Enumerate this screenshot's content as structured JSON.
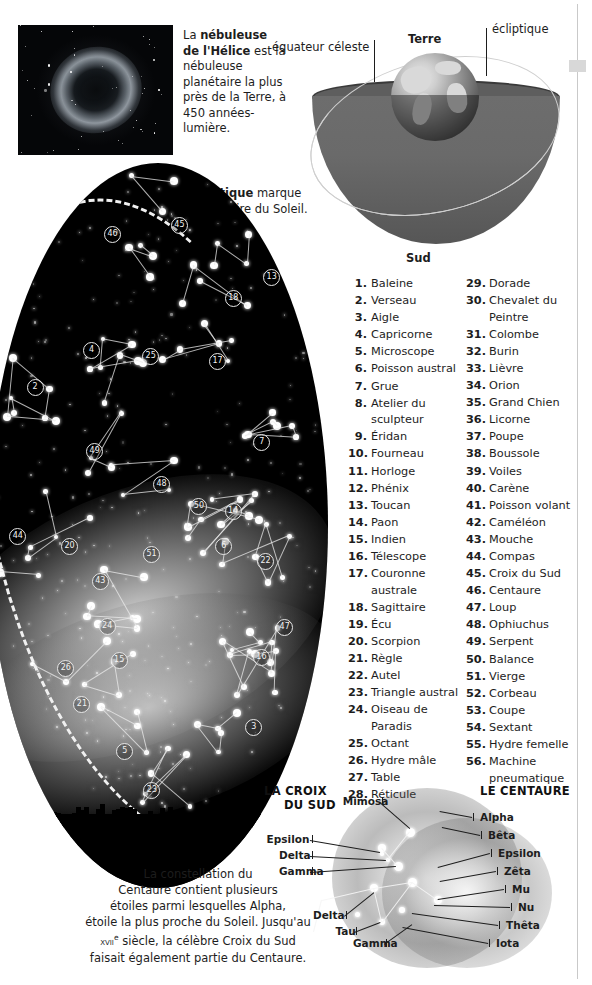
{
  "nebula": {
    "caption_lead": "La ",
    "caption_bold": "nébuleuse de l'Hélice",
    "caption_rest": " est la nébuleuse planétaire la plus près de la Terre, à 450 années-lumière."
  },
  "ecliptic_caption": {
    "bold": "L'écliptique",
    "rest": " marque la trajectoire du Soleil."
  },
  "sphere": {
    "label_equator": "équateur céleste",
    "label_earth": "Terre",
    "label_ecliptic": "écliptique",
    "label_south": "Sud"
  },
  "constellations": {
    "left": [
      {
        "num": "1.",
        "name": "Baleine"
      },
      {
        "num": "2.",
        "name": "Verseau"
      },
      {
        "num": "3.",
        "name": "Aigle"
      },
      {
        "num": "4.",
        "name": "Capricorne"
      },
      {
        "num": "5.",
        "name": "Microscope"
      },
      {
        "num": "6.",
        "name": "Poisson austral"
      },
      {
        "num": "7.",
        "name": "Grue"
      },
      {
        "num": "8.",
        "name": "Atelier du sculpteur"
      },
      {
        "num": "9.",
        "name": "Éridan"
      },
      {
        "num": "10.",
        "name": "Fourneau"
      },
      {
        "num": "11.",
        "name": "Horloge"
      },
      {
        "num": "12.",
        "name": "Phénix"
      },
      {
        "num": "13.",
        "name": "Toucan"
      },
      {
        "num": "14.",
        "name": "Paon"
      },
      {
        "num": "15.",
        "name": "Indien"
      },
      {
        "num": "16.",
        "name": "Télescope"
      },
      {
        "num": "17.",
        "name": "Couronne australe"
      },
      {
        "num": "18.",
        "name": "Sagittaire"
      },
      {
        "num": "19.",
        "name": "Écu"
      },
      {
        "num": "20.",
        "name": "Scorpion"
      },
      {
        "num": "21.",
        "name": "Règle"
      },
      {
        "num": "22.",
        "name": "Autel"
      },
      {
        "num": "23.",
        "name": "Triangle austral"
      },
      {
        "num": "24.",
        "name": "Oiseau de Paradis"
      },
      {
        "num": "25.",
        "name": "Octant"
      },
      {
        "num": "26.",
        "name": "Hydre mâle"
      },
      {
        "num": "27.",
        "name": "Table"
      },
      {
        "num": "28.",
        "name": "Réticule"
      }
    ],
    "right": [
      {
        "num": "29.",
        "name": "Dorade"
      },
      {
        "num": "30.",
        "name": "Chevalet du Peintre"
      },
      {
        "num": "31.",
        "name": "Colombe"
      },
      {
        "num": "32.",
        "name": "Burin"
      },
      {
        "num": "33.",
        "name": "Lièvre"
      },
      {
        "num": "34.",
        "name": "Orion"
      },
      {
        "num": "35.",
        "name": "Grand Chien"
      },
      {
        "num": "36.",
        "name": "Licorne"
      },
      {
        "num": "37.",
        "name": "Poupe"
      },
      {
        "num": "38.",
        "name": "Boussole"
      },
      {
        "num": "39.",
        "name": "Voiles"
      },
      {
        "num": "40.",
        "name": "Carène"
      },
      {
        "num": "41.",
        "name": "Poisson volant"
      },
      {
        "num": "42.",
        "name": "Caméléon"
      },
      {
        "num": "43.",
        "name": "Mouche"
      },
      {
        "num": "44.",
        "name": "Compas"
      },
      {
        "num": "45.",
        "name": "Croix du Sud"
      },
      {
        "num": "46.",
        "name": "Centaure"
      },
      {
        "num": "47.",
        "name": "Loup"
      },
      {
        "num": "48.",
        "name": "Ophiuchus"
      },
      {
        "num": "49.",
        "name": "Serpent"
      },
      {
        "num": "50.",
        "name": "Balance"
      },
      {
        "num": "51.",
        "name": "Vierge"
      },
      {
        "num": "52.",
        "name": "Corbeau"
      },
      {
        "num": "53.",
        "name": "Coupe"
      },
      {
        "num": "54.",
        "name": "Sextant"
      },
      {
        "num": "55.",
        "name": "Hydre femelle"
      },
      {
        "num": "56.",
        "name": "Machine pneumatique"
      }
    ]
  },
  "chart_markers": [
    "2",
    "3",
    "4",
    "5",
    "6",
    "7",
    "13",
    "14",
    "15",
    "16",
    "17",
    "18",
    "20",
    "21",
    "22",
    "23",
    "24",
    "25",
    "26",
    "43",
    "44",
    "45",
    "46",
    "47",
    "48",
    "49",
    "50",
    "51"
  ],
  "bottom_caption": {
    "line1": "La constellation du",
    "line2": "Centaure contient plusieurs",
    "line3": "étoiles parmi lesquelles Alpha,",
    "line4": "étoile la plus proche du Soleil. Jusqu'au",
    "century": "xvii",
    "century_sup": "e",
    "line5_rest": " siècle, la célèbre Croix du Sud",
    "line6": "faisait également partie du Centaure."
  },
  "croix_map": {
    "title_line1": "LA CROIX",
    "title_line2": "DU SUD",
    "labels": [
      {
        "text": "Mimosa"
      },
      {
        "text": "Epsilon"
      },
      {
        "text": "Delta"
      },
      {
        "text": "Gamma"
      },
      {
        "text": "Delta"
      },
      {
        "text": "Tau"
      },
      {
        "text": "Gamma"
      }
    ]
  },
  "centaure_map": {
    "title": "LE CENTAURE",
    "labels": [
      {
        "text": "Alpha"
      },
      {
        "text": "Bêta"
      },
      {
        "text": "Epsilon"
      },
      {
        "text": "Zêta"
      },
      {
        "text": "Mu"
      },
      {
        "text": "Nu"
      },
      {
        "text": "Thêta"
      },
      {
        "text": "Iota"
      }
    ]
  },
  "colors": {
    "ink": "#1d1d1d",
    "sky": "#000000",
    "star": "#ffffff",
    "sphere": "#6d6d6d",
    "rule": "#c9c9c9"
  }
}
